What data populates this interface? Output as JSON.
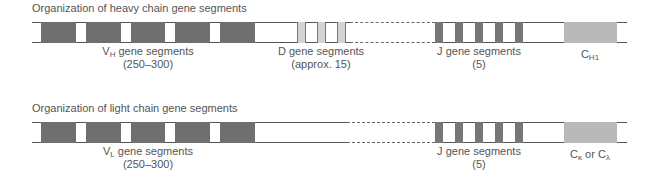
{
  "heavy": {
    "title": "Organization of heavy chain gene segments",
    "v_label": {
      "main": "V",
      "sub": "H",
      "rest": " gene segments",
      "line2": "(250–300)"
    },
    "d_label": {
      "line1": "D gene segments",
      "line2": "(approx. 15)"
    },
    "j_label": {
      "line1": "J gene segments",
      "line2": "(5)"
    },
    "c_label": {
      "main": "C",
      "sub": "H1"
    }
  },
  "light": {
    "title": "Organization of light chain gene segments",
    "v_label": {
      "main": "V",
      "sub": "L",
      "rest": " gene segments",
      "line2": "(250–300)"
    },
    "j_label": {
      "line1": "J gene segments",
      "line2": "(5)"
    },
    "c_label": {
      "main1": "C",
      "sub1": "κ",
      "or": " or ",
      "main2": "C",
      "sub2": "λ"
    }
  },
  "colors": {
    "v_segment": "#6f6f6f",
    "d_segment": "#d4d4d4",
    "j_segment": "#777777",
    "c_segment": "#b9b9b9",
    "line": "#555555"
  }
}
